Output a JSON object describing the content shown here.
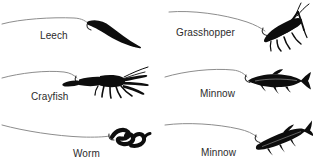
{
  "figure": {
    "background_color": "#ffffff",
    "line_color": "#8d8d8d",
    "silhouette_color": "#0d0d0d",
    "label_color": "#2b2b2b",
    "columns": 2,
    "rows": 3
  },
  "baits": [
    {
      "label": "Leech",
      "icon": "leech-silhouette-icon",
      "position": {
        "column": 1,
        "row": 1
      },
      "orientation": "angled down-right",
      "hook_side": "upper-left"
    },
    {
      "label": "Grasshopper",
      "icon": "grasshopper-silhouette-icon",
      "position": {
        "column": 2,
        "row": 1
      },
      "orientation": "head up-right",
      "hook_side": "upper-left"
    },
    {
      "label": "Crayfish",
      "icon": "crayfish-silhouette-icon",
      "position": {
        "column": 1,
        "row": 2
      },
      "orientation": "claws right, tail left",
      "hook_side": "left"
    },
    {
      "label": "Minnow",
      "icon": "minnow-silhouette-icon",
      "position": {
        "column": 2,
        "row": 2
      },
      "orientation": "horizontal, head left",
      "hook_side": "mouth"
    },
    {
      "label": "Worm",
      "icon": "worm-silhouette-icon",
      "position": {
        "column": 1,
        "row": 3
      },
      "orientation": "coiled zigzag",
      "hook_side": "left"
    },
    {
      "label": "Minnow",
      "icon": "minnow-silhouette-icon",
      "position": {
        "column": 2,
        "row": 3
      },
      "orientation": "angled tail up-right",
      "hook_side": "mouth"
    }
  ]
}
